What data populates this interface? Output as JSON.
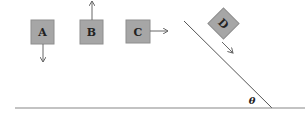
{
  "diagram": {
    "blocks": [
      {
        "label": "A",
        "arrow": "down"
      },
      {
        "label": "B",
        "arrow": "up"
      },
      {
        "label": "C",
        "arrow": "right"
      },
      {
        "label": "D",
        "arrow": "down-incline"
      }
    ],
    "angle_label": "θ",
    "colors": {
      "block_fill": "#a6a6a6",
      "block_stroke": "#8a8a8a",
      "line": "#555555"
    }
  }
}
